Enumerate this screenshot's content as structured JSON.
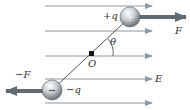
{
  "diagram": {
    "labels": {
      "positive_charge": "+q",
      "negative_charge": "−q",
      "force_positive": "F",
      "force_negative": "−F",
      "pivot": "O",
      "angle": "θ",
      "field": "E"
    },
    "field_lines": {
      "count": 5,
      "y": [
        6,
        31,
        56,
        79,
        103
      ],
      "x_start": 45,
      "x_end": 152
    },
    "colors": {
      "field_line": "#8a9aa6",
      "force_arrow": "#5f6a72",
      "dipole_rod": "#555555",
      "sphere_light": "#f4f4f4",
      "sphere_dark": "#6b7378"
    }
  }
}
